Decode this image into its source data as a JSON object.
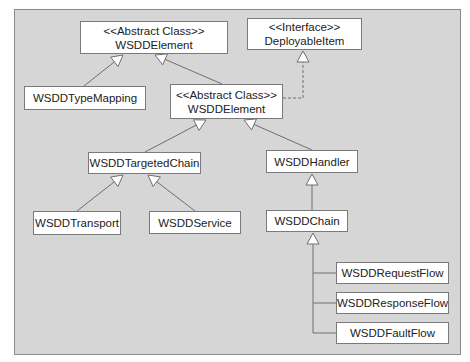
{
  "diagram": {
    "type": "uml-class-hierarchy",
    "colors": {
      "background": "#d6d6d6",
      "box_fill": "#ffffff",
      "box_border": "#7a7a7a",
      "line": "#6e6e6e",
      "text": "#222222"
    },
    "nodes": [
      {
        "id": "root",
        "stereotype": "<<Abstract Class>>",
        "name": "WSDDElement"
      },
      {
        "id": "iface",
        "stereotype": "<<Interface>>",
        "name": "DeployableItem"
      },
      {
        "id": "typemap",
        "stereotype": "",
        "name": "WSDDTypeMapping"
      },
      {
        "id": "deploy",
        "stereotype": "<<Abstract Class>>",
        "name": "WSDDElement"
      },
      {
        "id": "tchain",
        "stereotype": "",
        "name": "WSDDTargetedChain"
      },
      {
        "id": "handler",
        "stereotype": "",
        "name": "WSDDHandler"
      },
      {
        "id": "transport",
        "stereotype": "",
        "name": "WSDDTransport"
      },
      {
        "id": "service",
        "stereotype": "",
        "name": "WSDDService"
      },
      {
        "id": "chain",
        "stereotype": "",
        "name": "WSDDChain"
      },
      {
        "id": "reqflow",
        "stereotype": "",
        "name": "WSDDRequestFlow"
      },
      {
        "id": "respflow",
        "stereotype": "",
        "name": "WSDDResponseFlow"
      },
      {
        "id": "faultflow",
        "stereotype": "",
        "name": "WSDDFaultFlow"
      }
    ],
    "edges": [
      {
        "from": "typemap",
        "to": "root",
        "kind": "inheritance"
      },
      {
        "from": "deploy",
        "to": "root",
        "kind": "inheritance"
      },
      {
        "from": "deploy",
        "to": "iface",
        "kind": "realization"
      },
      {
        "from": "tchain",
        "to": "deploy",
        "kind": "inheritance"
      },
      {
        "from": "handler",
        "to": "deploy",
        "kind": "inheritance"
      },
      {
        "from": "transport",
        "to": "tchain",
        "kind": "inheritance"
      },
      {
        "from": "service",
        "to": "tchain",
        "kind": "inheritance"
      },
      {
        "from": "chain",
        "to": "handler",
        "kind": "inheritance"
      },
      {
        "from": "reqflow",
        "to": "chain",
        "kind": "inheritance"
      },
      {
        "from": "respflow",
        "to": "chain",
        "kind": "inheritance"
      },
      {
        "from": "faultflow",
        "to": "chain",
        "kind": "inheritance"
      }
    ]
  }
}
